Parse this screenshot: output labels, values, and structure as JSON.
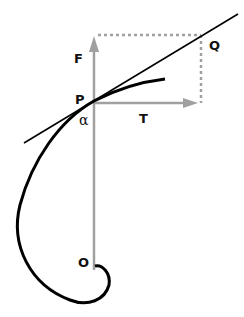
{
  "diagram": {
    "labels": {
      "force": "F",
      "tangent_force": "T",
      "point": "P",
      "point_q": "Q",
      "origin": "O",
      "angle": "α"
    },
    "colors": {
      "axis": "#a0a0a0",
      "curve": "#000000",
      "tangent_line": "#000000",
      "dotted": "#a0a0a0",
      "background": "#ffffff"
    }
  }
}
